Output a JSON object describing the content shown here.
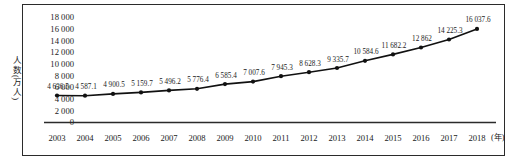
{
  "chart_data": {
    "type": "line",
    "title": "",
    "xlabel": "年",
    "ylabel": "人数(万人)",
    "categories": [
      "2003",
      "2004",
      "2005",
      "2006",
      "2007",
      "2008",
      "2009",
      "2010",
      "2011",
      "2012",
      "2013",
      "2014",
      "2015",
      "2016",
      "2017",
      "2018"
    ],
    "values": [
      4636.5,
      4587.1,
      4900.5,
      5159.7,
      5496.2,
      5776.4,
      6585.4,
      7007.6,
      7945.3,
      8628.3,
      9335.7,
      10584.6,
      11682.2,
      12862,
      14225.3,
      16037.6
    ],
    "point_labels": [
      "4 636.5",
      "4 587.1",
      "4 900.5",
      "5 159.7",
      "5 496.2",
      "5 776.4",
      "6 585.4",
      "7 007.6",
      "7 945.3",
      "8 628.3",
      "9 335.7",
      "10 584.6",
      "11 682.2",
      "12 862",
      "14 225.3",
      "16 037.6"
    ],
    "ylim": [
      0,
      18000
    ],
    "ytick_values": [
      0,
      2000,
      4000,
      6000,
      8000,
      10000,
      12000,
      14000,
      16000,
      18000
    ],
    "ytick_labels": [
      "0",
      "2 000",
      "4 000",
      "6 000",
      "8 000",
      "10 000",
      "12 000",
      "14 000",
      "16 000",
      "18 000"
    ],
    "grid": false,
    "legend": "none",
    "series_color": "#111111",
    "marker": "filled-circle",
    "axis_color": "#2b2b2b"
  },
  "axis": {
    "y_title": "人数(万人)",
    "x_unit": "(年)"
  }
}
